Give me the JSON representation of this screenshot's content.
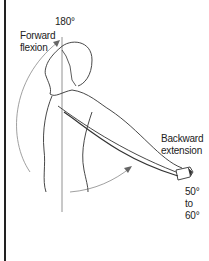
{
  "figure": {
    "type": "shoulder range of motion illustration",
    "labels": {
      "top_angle": "180°",
      "forward_line1": "Forward",
      "forward_line2": "flexion",
      "backward_line1": "Backward",
      "backward_line2": "extension",
      "range_line1": "50°",
      "range_line2": "to",
      "range_line3": "60°"
    }
  }
}
